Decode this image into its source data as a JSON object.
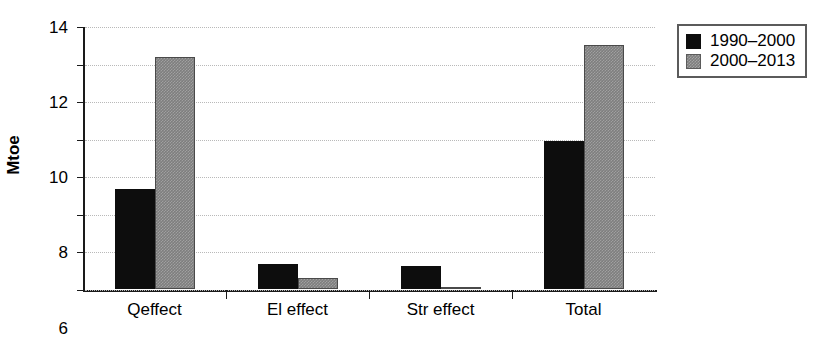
{
  "chart_data": {
    "type": "bar",
    "title": "",
    "xlabel": "",
    "ylabel": "Mtoe",
    "categories": [
      "Qeffect",
      "El effect",
      "Str effect",
      "Total"
    ],
    "series": [
      {
        "name": "1990–2000",
        "color": "#0d0d0d",
        "values": [
          5.3,
          1.35,
          1.2,
          7.9
        ]
      },
      {
        "name": "2000–2013",
        "color": "#7e7e7e",
        "values": [
          12.35,
          0.6,
          0.1,
          13.0
        ]
      }
    ],
    "ylim": [
      0,
      14
    ],
    "yticks": [
      0,
      2,
      4,
      6,
      8,
      10,
      12,
      14
    ],
    "ytick_labels": [
      "0",
      "2",
      "4",
      "6",
      "8",
      "10",
      "12",
      "14"
    ],
    "grid": true,
    "grid_axis": "y",
    "legend_position": "right-top",
    "bar_orientation": "vertical"
  },
  "legend": {
    "items": [
      {
        "label": "1990–2000",
        "swatch": "black-square-swatch"
      },
      {
        "label": "2000–2013",
        "swatch": "gray-square-swatch"
      }
    ]
  },
  "axes": {
    "y_axis_title": "Mtoe"
  }
}
